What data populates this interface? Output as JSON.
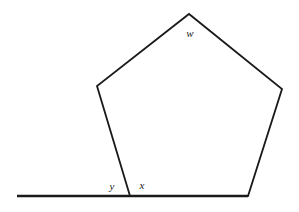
{
  "figure": {
    "name": "pentagon-exterior-angle-diagram",
    "width": 299,
    "height": 212,
    "background_color": "#ffffff",
    "stroke_color": "#1a1a1a",
    "shape_stroke_width": 1.8,
    "baseline_stroke_width": 2.4
  },
  "shape": {
    "type": "pentagon",
    "sides": 5,
    "fill": "none",
    "points_attr": "130,196 97,86 189,14 282,89 248,196",
    "vertices": [
      {
        "name": "base-left-vertex",
        "x": 130,
        "y": 196
      },
      {
        "name": "upper-left-vertex",
        "x": 97,
        "y": 86
      },
      {
        "name": "apex-vertex",
        "x": 189,
        "y": 14
      },
      {
        "name": "upper-right-vertex",
        "x": 282,
        "y": 89
      },
      {
        "name": "base-right-vertex",
        "x": 248,
        "y": 196
      }
    ]
  },
  "baseline": {
    "name": "horizontal-baseline",
    "x1": 17,
    "y1": 196,
    "x2": 248,
    "y2": 196
  },
  "labels": {
    "w": {
      "text": "w",
      "x": 190,
      "y": 34
    },
    "y": {
      "text": "y",
      "x": 112,
      "y": 187
    },
    "x": {
      "text": "x",
      "x": 142,
      "y": 186
    }
  }
}
